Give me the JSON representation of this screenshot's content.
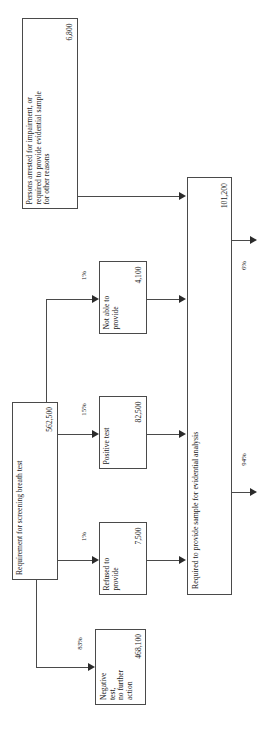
{
  "figure": {
    "orientation": "rotated-90-ccw",
    "line_color": "#4a4a4a",
    "text_color": "#1a1a1a",
    "background": "#ffffff"
  },
  "nodes": {
    "arrested": {
      "title": "Persons arrested for impairment, or\nrequired to provide evidential sample\nfor other reasons",
      "value": "6,800"
    },
    "screening": {
      "title": "Requirement for screening breath test",
      "value": "562,500"
    },
    "not_able": {
      "title": "Not able to\nprovide",
      "value": "4,100"
    },
    "positive": {
      "title": "Positive test",
      "value": "82,500"
    },
    "refused": {
      "title": "Refused to\nprovide",
      "value": "7,500"
    },
    "negative": {
      "title": "Negative test,\nno further\naction",
      "value": "468,100"
    },
    "evidential": {
      "title": "Required to provide sample for evidential analysis",
      "value": "101,200"
    }
  },
  "edge_labels": {
    "not_able_pct": "1%",
    "positive_pct": "15%",
    "refused_pct": "1%",
    "negative_pct": "83%",
    "out_top_pct": "6%",
    "out_bottom_pct": "94%"
  }
}
